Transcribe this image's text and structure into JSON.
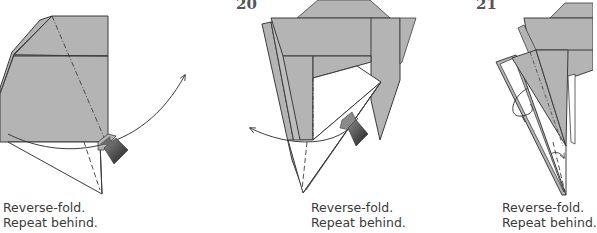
{
  "colors": {
    "paper_gray": "#b4b4b4",
    "paper_gray_light": "#bdbdbd",
    "stroke": "#3c3c3c",
    "white": "#ffffff",
    "arrow_dark": "#2a2a2a",
    "text": "#3a3a3a"
  },
  "steps": [
    {
      "number": "",
      "caption_line1": "Reverse-fold.",
      "caption_line2": "Repeat behind."
    },
    {
      "number": "20",
      "caption_line1": "Reverse-fold.",
      "caption_line2": "Repeat behind."
    },
    {
      "number": "21",
      "caption_line1": "Reverse-fold.",
      "caption_line2": "Repeat behind."
    }
  ]
}
